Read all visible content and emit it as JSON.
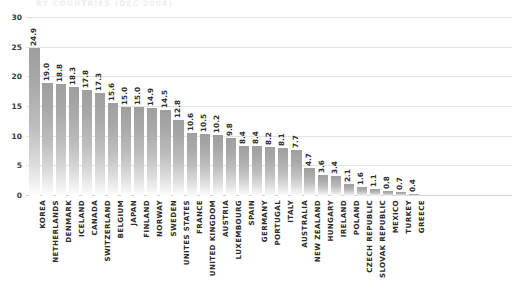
{
  "chart_data": {
    "type": "bar",
    "title": "BY COUNTRIES (DEC 2004)",
    "xlabel": "",
    "ylabel": "",
    "ylim": [
      0,
      30
    ],
    "ytick_values": [
      30,
      25,
      20,
      15,
      10,
      5,
      0
    ],
    "ytick_labels": [
      "30",
      "25",
      "20",
      "15",
      "10",
      "5",
      "0"
    ],
    "grid": "horizontal",
    "legend": "none",
    "categories": [
      "KOREA",
      "NETHERLANDS",
      "DENMARK",
      "ICELAND",
      "CANADA",
      "SWITZERLAND",
      "BELGIUM",
      "JAPAN",
      "FINLAND",
      "NORWAY",
      "SWEDEN",
      "UNITES STATES",
      "FRANCE",
      "UNITED KINGDOM",
      "AUSTRIA",
      "LUXEMBOURG",
      "SPAIN",
      "GERMANY",
      "PORTUGAL",
      "ITALY",
      "AUSTRALIA",
      "NEW ZEALAND",
      "HUNGARY",
      "IRELAND",
      "POLAND",
      "CZECH REPUBLIC",
      "SLOVAK REPUBLIC",
      "MEXICO",
      "TURKEY",
      "GREECE"
    ],
    "values": [
      24.9,
      19.0,
      18.8,
      18.3,
      17.8,
      17.3,
      15.6,
      15.0,
      15.0,
      14.9,
      14.5,
      12.8,
      10.6,
      10.5,
      10.2,
      9.8,
      8.4,
      8.4,
      8.2,
      8.1,
      7.7,
      4.7,
      3.6,
      3.4,
      2.1,
      1.6,
      1.1,
      0.8,
      0.7,
      0.4
    ],
    "value_labels": [
      "24.9",
      "19.0",
      "18.8",
      "18.3",
      "17.8",
      "17.3",
      "15.6",
      "15.0",
      "15.0",
      "14.9",
      "14.5",
      "12.8",
      "10.6",
      "10.5",
      "10.2",
      "9.8",
      "8.4",
      "8.4",
      "8.2",
      "8.1",
      "7.7",
      "4.7",
      "3.6",
      "3.4",
      "2.1",
      "1.6",
      "1.1",
      "0.8",
      "0.7",
      "0.4"
    ],
    "colors": {
      "bar_top": "#9f9f9f",
      "bar_bottom": "#ffffff",
      "gridline": "#e4e4e4",
      "axis": "#d0d0d0",
      "title": "#eeeeee",
      "tick_text": "#3a3a3a"
    }
  }
}
